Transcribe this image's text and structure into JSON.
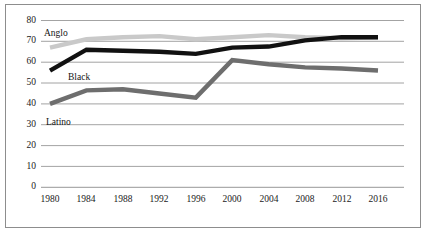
{
  "chart_data": {
    "type": "line",
    "title": "",
    "subtitle": "",
    "xlabel": "",
    "ylabel": "",
    "categories": [
      "1980",
      "1984",
      "1988",
      "1992",
      "1996",
      "2000",
      "2004",
      "2008",
      "2012",
      "2016"
    ],
    "x": [
      1980,
      1984,
      1988,
      1992,
      1996,
      2000,
      2004,
      2008,
      2012,
      2016
    ],
    "ylim": [
      0,
      80
    ],
    "yticks": [
      0,
      10,
      20,
      30,
      40,
      50,
      60,
      70,
      80
    ],
    "ytick_labels": [
      "0",
      "10",
      "20",
      "30",
      "40",
      "50",
      "60",
      "70",
      "80"
    ],
    "xtick_labels": [
      "1980",
      "1984",
      "1988",
      "1992",
      "1996",
      "2000",
      "2004",
      "2008",
      "2012",
      "2016"
    ],
    "grid": "horizontal",
    "legend_position": "inline-annotations",
    "series": [
      {
        "name": "Anglo",
        "color": "#c9c9c9",
        "label_text": "Anglo",
        "values": [
          67,
          71,
          72,
          72.5,
          71,
          72,
          73,
          72,
          71.5,
          72
        ]
      },
      {
        "name": "Black",
        "color": "#111111",
        "label_text": "Black",
        "values": [
          56,
          66,
          65.5,
          65,
          64,
          67,
          67.5,
          70.5,
          72,
          72
        ]
      },
      {
        "name": "Latino",
        "color": "#6e6e6e",
        "label_text": "Latino",
        "values": [
          40,
          46.5,
          47,
          45,
          43,
          61,
          59,
          57.5,
          57,
          56
        ]
      }
    ],
    "annotations": [
      {
        "text": "Anglo",
        "series": "Anglo"
      },
      {
        "text": "Black",
        "series": "Black"
      },
      {
        "text": "Latino",
        "series": "Latino"
      }
    ]
  },
  "colors": {
    "anglo": "#c9c9c9",
    "black": "#111111",
    "latino": "#6e6e6e",
    "gridline": "#8c8c8c",
    "frame": "#8d8d8d",
    "text": "#1a1a1a",
    "background": "#ffffff"
  },
  "labels": {
    "y_0": "0",
    "y_10": "10",
    "y_20": "20",
    "y_30": "30",
    "y_40": "40",
    "y_50": "50",
    "y_60": "60",
    "y_70": "70",
    "y_80": "80",
    "x_1980": "1980",
    "x_1984": "1984",
    "x_1988": "1988",
    "x_1992": "1992",
    "x_1996": "1996",
    "x_2000": "2000",
    "x_2004": "2004",
    "x_2008": "2008",
    "x_2012": "2012",
    "x_2016": "2016",
    "anglo": "Anglo",
    "black": "Black",
    "latino": "Latino"
  }
}
